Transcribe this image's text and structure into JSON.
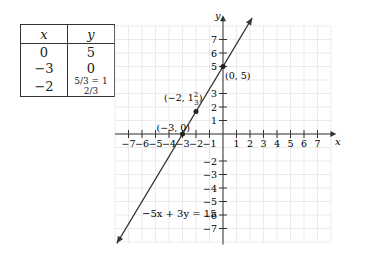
{
  "table": {
    "headers": [
      "x",
      "y"
    ],
    "rows": [
      {
        "x": "0",
        "y": "5"
      },
      {
        "x": "−3",
        "y": "0"
      },
      {
        "x": "−2",
        "y": "5/3 = 1 2/3"
      }
    ]
  },
  "chart_data": {
    "type": "line",
    "title": "",
    "xlabel": "x",
    "ylabel": "y",
    "xlim": [
      -8,
      8
    ],
    "ylim": [
      -8,
      8
    ],
    "grid": true,
    "x_ticks": [
      -7,
      -6,
      -5,
      -4,
      -3,
      -2,
      -1,
      1,
      2,
      3,
      4,
      5,
      6,
      7
    ],
    "y_ticks": [
      -7,
      -6,
      -5,
      -4,
      -3,
      -2,
      1,
      2,
      3,
      5,
      6,
      7
    ],
    "series": [
      {
        "name": "-5x + 3y = 15",
        "equation": "-5x + 3y = 15",
        "slope": 1.6667,
        "intercept": 5
      }
    ],
    "points": [
      {
        "x": 0,
        "y": 5,
        "label": "(0, 5)"
      },
      {
        "x": -2,
        "y": 1.6667,
        "label": "(−2, 1 2/3)"
      },
      {
        "x": -3,
        "y": 0,
        "label": "(−3, 0)"
      }
    ],
    "annotations": [
      "-5x + 3y = 15"
    ]
  },
  "labels": {
    "equation": "−5x + 3y = 15",
    "p1": "(0, 5)",
    "p2_prefix": "(−2, 1",
    "p2_num": "2",
    "p2_den": "3",
    "p3": "(−3, 0)",
    "x_axis": "x",
    "y_axis": "y"
  }
}
